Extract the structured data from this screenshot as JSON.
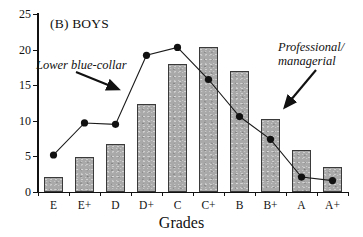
{
  "chart_data": {
    "type": "bar",
    "title": "(B) BOYS",
    "xlabel": "Grades",
    "ylabel": "",
    "categories": [
      "E",
      "E+",
      "D",
      "D+",
      "C",
      "C+",
      "B",
      "B+",
      "A",
      "A+"
    ],
    "ylim": [
      0,
      25
    ],
    "yticks": [
      0,
      5,
      10,
      15,
      20,
      25
    ],
    "grid": false,
    "legend_position": "inline-annotations",
    "series": [
      {
        "name": "Professional/managerial",
        "render": "bar",
        "values": [
          2.1,
          4.9,
          6.8,
          12.4,
          18.0,
          20.4,
          17.0,
          10.2,
          5.9,
          3.5
        ]
      },
      {
        "name": "Lower blue-collar",
        "render": "line",
        "values": [
          5.2,
          9.7,
          9.5,
          19.2,
          20.3,
          15.8,
          10.6,
          7.4,
          2.1,
          1.6
        ]
      }
    ],
    "annotations": [
      {
        "text": "Lower blue-collar",
        "target": "line-series"
      },
      {
        "text": "Professional/",
        "target": "bar-series"
      },
      {
        "text": "managerial",
        "target": "bar-series"
      }
    ]
  },
  "colors": {
    "bar_fill": "#a9a9a9",
    "bar_edge": "#3a3a3a",
    "line": "#1a1a1a",
    "marker": "#111111",
    "axis": "#111111",
    "background": "#ffffff"
  },
  "annotation_text": {
    "left": "Lower blue-collar",
    "right_line1": "Professional/",
    "right_line2": "managerial"
  }
}
